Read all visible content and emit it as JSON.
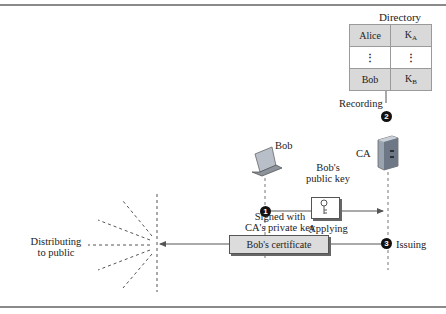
{
  "directory": {
    "title": "Directory",
    "rows": [
      {
        "name": "Alice",
        "key": "K",
        "key_sub": "A"
      },
      {
        "name": "⋮",
        "key": "⋮",
        "key_sub": ""
      },
      {
        "name": "Bob",
        "key": "K",
        "key_sub": "B"
      }
    ]
  },
  "steps": [
    {
      "number": "1",
      "label": "Applying"
    },
    {
      "number": "2",
      "label": "Recording"
    },
    {
      "number": "3",
      "label": "Issuing"
    }
  ],
  "actors": {
    "bob": "Bob",
    "ca": "CA"
  },
  "labels": {
    "bobs_public_key_line1": "Bob's",
    "bobs_public_key_line2": "public key",
    "signed_line1": "Signed with",
    "signed_line2": "CA's private key",
    "certificate": "Bob's certificate",
    "distributing_line1": "Distributing",
    "distributing_line2": "to public"
  },
  "icons": {
    "bob_device": "laptop-icon",
    "ca_device": "server-icon",
    "key": "key-icon"
  },
  "colors": {
    "table_shade": "#d9d9d9",
    "certificate_fill": "#dcdcdc",
    "server": "#8a96a6",
    "rule": "#8a8a8a"
  }
}
